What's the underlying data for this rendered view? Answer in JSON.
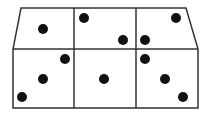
{
  "diagram": {
    "colors": {
      "background": "#ffffff",
      "line": "#333333",
      "dot": "#111111"
    },
    "outline": {
      "top_left": [
        21,
        8
      ],
      "top_right": [
        186,
        8
      ],
      "mid_left": [
        13,
        49
      ],
      "mid_right": [
        198,
        49
      ],
      "bottom_left": [
        13,
        108
      ],
      "bottom_right": [
        198,
        108
      ]
    },
    "dividers_x": [
      74,
      136
    ],
    "dot_radius": 5,
    "cells": [
      {
        "id": "top-left",
        "dots": [
          [
            43,
            29
          ]
        ]
      },
      {
        "id": "top-middle",
        "dots": [
          [
            84,
            18
          ],
          [
            123,
            40
          ]
        ]
      },
      {
        "id": "top-right",
        "dots": [
          [
            145,
            40
          ],
          [
            176,
            18
          ]
        ]
      },
      {
        "id": "bottom-left",
        "dots": [
          [
            65,
            59
          ],
          [
            43,
            79
          ],
          [
            22,
            97
          ]
        ]
      },
      {
        "id": "bottom-middle",
        "dots": [
          [
            104,
            79
          ]
        ]
      },
      {
        "id": "bottom-right",
        "dots": [
          [
            145,
            59
          ],
          [
            165,
            79
          ],
          [
            183,
            97
          ]
        ]
      }
    ],
    "dot_count": 12
  }
}
